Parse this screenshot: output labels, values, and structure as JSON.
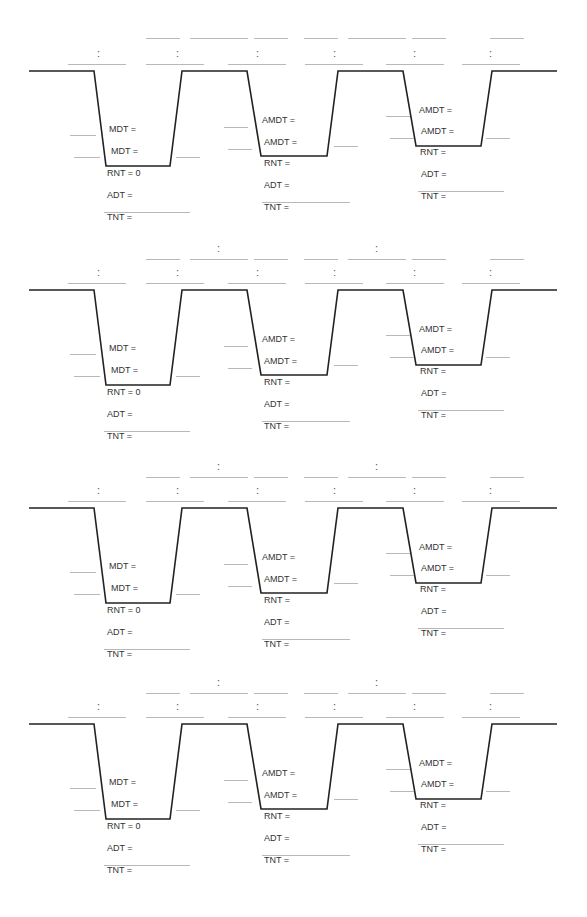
{
  "worksheet": {
    "profile_count": 4,
    "colors": {
      "profile_line": "#222222",
      "blank_line": "#b8b8b8",
      "text": "#333333"
    },
    "profiles": [
      {
        "id": 1,
        "top": 0,
        "upper_colons": false,
        "dive1": {
          "labels": [
            "MDT =",
            "MDT =",
            "RNT = 0",
            "ADT =",
            "TNT ="
          ]
        },
        "dive2": {
          "labels": [
            "AMDT =",
            "AMDT =",
            "RNT =",
            "ADT =",
            "TNT ="
          ]
        },
        "dive3": {
          "labels": [
            "AMDT =",
            "AMDT =",
            "RNT =",
            "ADT =",
            "TNT ="
          ]
        },
        "time_colons": [
          ":",
          ":",
          ":",
          ":",
          ":",
          ":"
        ],
        "upper_time_colons": []
      },
      {
        "id": 2,
        "top": 219,
        "upper_colons": true,
        "dive1": {
          "labels": [
            "MDT =",
            "MDT =",
            "RNT = 0",
            "ADT =",
            "TNT ="
          ]
        },
        "dive2": {
          "labels": [
            "AMDT =",
            "AMDT =",
            "RNT =",
            "ADT =",
            "TNT ="
          ]
        },
        "dive3": {
          "labels": [
            "AMDT =",
            "AMDT =",
            "RNT =",
            "ADT =",
            "TNT ="
          ]
        },
        "time_colons": [
          ":",
          ":",
          ":",
          ":",
          ":",
          ":"
        ],
        "upper_time_colons": [
          ":",
          ":"
        ]
      },
      {
        "id": 3,
        "top": 437,
        "upper_colons": true,
        "dive1": {
          "labels": [
            "MDT =",
            "MDT =",
            "RNT = 0",
            "ADT =",
            "TNT ="
          ]
        },
        "dive2": {
          "labels": [
            "AMDT =",
            "AMDT =",
            "RNT =",
            "ADT =",
            "TNT ="
          ]
        },
        "dive3": {
          "labels": [
            "AMDT =",
            "AMDT =",
            "RNT =",
            "ADT =",
            "TNT ="
          ]
        },
        "time_colons": [
          ":",
          ":",
          ":",
          ":",
          ":",
          ":"
        ],
        "upper_time_colons": [
          ":",
          ":"
        ]
      },
      {
        "id": 4,
        "top": 653,
        "upper_colons": true,
        "dive1": {
          "labels": [
            "MDT =",
            "MDT =",
            "RNT = 0",
            "ADT =",
            "TNT ="
          ]
        },
        "dive2": {
          "labels": [
            "AMDT =",
            "AMDT =",
            "RNT =",
            "ADT =",
            "TNT ="
          ]
        },
        "dive3": {
          "labels": [
            "AMDT =",
            "AMDT =",
            "RNT =",
            "ADT =",
            "TNT ="
          ]
        },
        "time_colons": [
          ":",
          ":",
          ":",
          ":",
          ":",
          ":"
        ],
        "upper_time_colons": [
          ":",
          ":"
        ]
      }
    ]
  }
}
